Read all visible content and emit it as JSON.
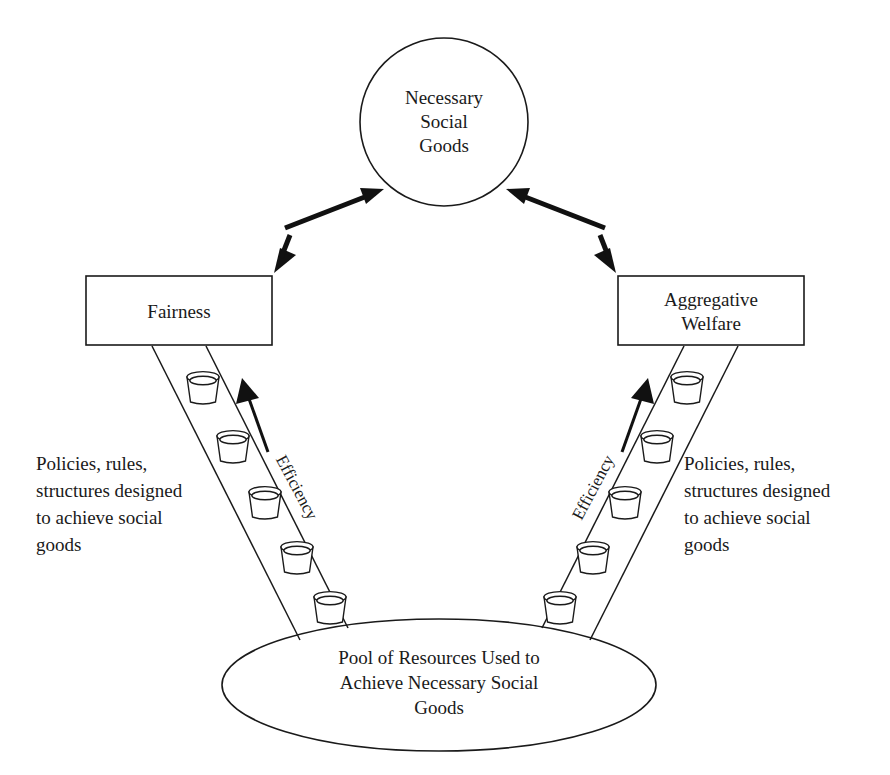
{
  "diagram": {
    "background_color": "#ffffff",
    "line_color": "#1a1a1a",
    "top_node": {
      "shape": "circle",
      "lines": [
        "Necessary",
        "Social",
        "Goods"
      ]
    },
    "left_box": {
      "shape": "rectangle",
      "lines": [
        "Fairness"
      ]
    },
    "right_box": {
      "shape": "rectangle",
      "lines": [
        "Aggregative",
        "Welfare"
      ]
    },
    "bottom_node": {
      "shape": "ellipse",
      "lines": [
        "Pool of Resources Used to",
        "Achieve Necessary Social",
        "Goods"
      ]
    },
    "left_note": {
      "lines": [
        "Policies, rules,",
        "structures designed",
        "to achieve social",
        "goods"
      ]
    },
    "right_note": {
      "lines": [
        "Policies, rules,",
        "structures designed",
        "to achieve social",
        "goods"
      ]
    },
    "left_efficiency": {
      "label": "Efficiency"
    },
    "right_efficiency": {
      "label": "Efficiency"
    },
    "connectors": [
      {
        "name": "fairness-to-goods",
        "style": "double-headed-arrow"
      },
      {
        "name": "welfare-to-goods",
        "style": "double-headed-arrow"
      },
      {
        "name": "left-efficiency-arrow",
        "style": "single-headed-arrow-up"
      },
      {
        "name": "right-efficiency-arrow",
        "style": "single-headed-arrow-up"
      }
    ],
    "left_cups": [
      {
        "cx": 203,
        "cy": 388
      },
      {
        "cx": 231,
        "cy": 446
      },
      {
        "cx": 262,
        "cy": 502
      },
      {
        "cx": 294,
        "cy": 557
      },
      {
        "cx": 326,
        "cy": 608
      }
    ],
    "right_cups": [
      {
        "cx": 687,
        "cy": 388
      },
      {
        "cx": 659,
        "cy": 446
      },
      {
        "cx": 628,
        "cy": 502
      },
      {
        "cx": 596,
        "cy": 557
      },
      {
        "cx": 564,
        "cy": 608
      }
    ]
  }
}
